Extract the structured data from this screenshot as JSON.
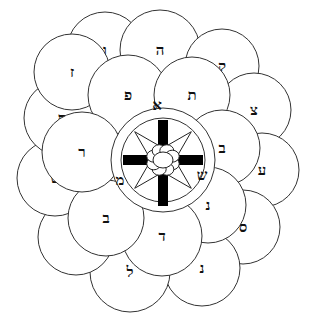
{
  "diagram": {
    "outer_ring": [
      {
        "letter": "ו",
        "cx": 105,
        "cy": 50,
        "r": 38
      },
      {
        "letter": "ה",
        "cx": 160,
        "cy": 50,
        "r": 40
      },
      {
        "letter": "ק",
        "cx": 222,
        "cy": 66,
        "r": 37
      },
      {
        "letter": "צ",
        "cx": 254,
        "cy": 110,
        "r": 37
      },
      {
        "letter": "ע",
        "cx": 262,
        "cy": 170,
        "r": 37
      },
      {
        "letter": "ס",
        "cx": 243,
        "cy": 227,
        "r": 37
      },
      {
        "letter": "נ",
        "cx": 202,
        "cy": 268,
        "r": 38
      },
      {
        "letter": "ל",
        "cx": 130,
        "cy": 272,
        "r": 40
      },
      {
        "letter": "י",
        "cx": 76,
        "cy": 237,
        "r": 38
      },
      {
        "letter": "ט",
        "cx": 55,
        "cy": 178,
        "r": 38
      },
      {
        "letter": "ח",
        "cx": 62,
        "cy": 118,
        "r": 38
      },
      {
        "letter": "ז",
        "cx": 72,
        "cy": 72,
        "r": 38
      }
    ],
    "inner_ring": [
      {
        "letter": "פ",
        "cx": 128,
        "cy": 95,
        "r": 40
      },
      {
        "letter": "ת",
        "cx": 192,
        "cy": 95,
        "r": 38
      },
      {
        "letter": "ב",
        "cx": 222,
        "cy": 148,
        "r": 38
      },
      {
        "letter": "נ",
        "cx": 208,
        "cy": 205,
        "r": 38
      },
      {
        "letter": "ד",
        "cx": 162,
        "cy": 236,
        "r": 40
      },
      {
        "letter": "ב",
        "cx": 106,
        "cy": 218,
        "r": 38
      },
      {
        "letter": "ר",
        "cx": 82,
        "cy": 152,
        "r": 40
      }
    ],
    "center": {
      "cx": 163,
      "cy": 160,
      "outer_r": 52,
      "inner_r": 42,
      "labels": [
        {
          "letter": "א",
          "x": 157,
          "y": 105
        },
        {
          "letter": "ש",
          "x": 202,
          "y": 175
        },
        {
          "letter": "מ",
          "x": 120,
          "y": 180
        }
      ]
    },
    "colors": {
      "stroke": "#333333",
      "fill": "#ffffff",
      "ink": "#111111"
    }
  }
}
